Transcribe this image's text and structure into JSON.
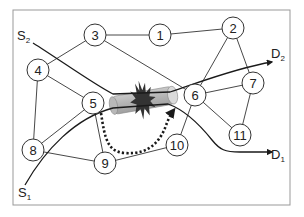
{
  "diagram": {
    "type": "network-topology",
    "frame": {
      "x": 13,
      "y": 10,
      "width": 277,
      "height": 195,
      "stroke": "#999999"
    },
    "node_radius": 11,
    "nodes": [
      {
        "id": "1",
        "label": "1",
        "x": 160,
        "y": 35
      },
      {
        "id": "2",
        "label": "2",
        "x": 233,
        "y": 28
      },
      {
        "id": "3",
        "label": "3",
        "x": 95,
        "y": 35
      },
      {
        "id": "4",
        "label": "4",
        "x": 38,
        "y": 70
      },
      {
        "id": "5",
        "label": "5",
        "x": 93,
        "y": 103
      },
      {
        "id": "6",
        "label": "6",
        "x": 195,
        "y": 95
      },
      {
        "id": "7",
        "label": "7",
        "x": 253,
        "y": 83
      },
      {
        "id": "8",
        "label": "8",
        "x": 33,
        "y": 150
      },
      {
        "id": "9",
        "label": "9",
        "x": 105,
        "y": 163
      },
      {
        "id": "10",
        "label": "10",
        "x": 177,
        "y": 145
      },
      {
        "id": "11",
        "label": "11",
        "x": 240,
        "y": 135
      }
    ],
    "edges": [
      [
        "3",
        "1"
      ],
      [
        "1",
        "2"
      ],
      [
        "3",
        "4"
      ],
      [
        "3",
        "6"
      ],
      [
        "2",
        "6"
      ],
      [
        "2",
        "7"
      ],
      [
        "4",
        "5"
      ],
      [
        "4",
        "8"
      ],
      [
        "6",
        "7"
      ],
      [
        "6",
        "11"
      ],
      [
        "7",
        "11"
      ],
      [
        "8",
        "9"
      ],
      [
        "9",
        "10"
      ],
      [
        "10",
        "6"
      ],
      [
        "5",
        "9"
      ],
      [
        "8",
        "5"
      ]
    ],
    "endpoints": [
      {
        "id": "S2",
        "main": "S",
        "sub": "2",
        "x": 17,
        "y": 40
      },
      {
        "id": "S1",
        "main": "S",
        "sub": "1",
        "x": 18,
        "y": 197
      },
      {
        "id": "D2",
        "main": "D",
        "sub": "2",
        "x": 271,
        "y": 58
      },
      {
        "id": "D1",
        "main": "D",
        "sub": "1",
        "x": 271,
        "y": 159
      }
    ],
    "paths": [
      {
        "id": "S2-D2",
        "from": "S2",
        "to": "D2",
        "style": "solid-arrow"
      },
      {
        "id": "S1-D1",
        "from": "S1",
        "to": "D1",
        "style": "solid-arrow"
      },
      {
        "id": "reroute",
        "from": "5",
        "to": "6",
        "via": [
          "9",
          "10"
        ],
        "style": "dotted-arrow"
      }
    ],
    "link_tube": {
      "between": [
        "5",
        "6"
      ],
      "fill": "#bdbdbd",
      "end_fill": "#dcdcdc"
    },
    "failure": {
      "type": "link-break-burst",
      "color": "#333333"
    },
    "colors": {
      "line": "#333333",
      "path": "#1a1a1a",
      "node_fill": "#ffffff",
      "node_stroke": "#333333"
    }
  }
}
